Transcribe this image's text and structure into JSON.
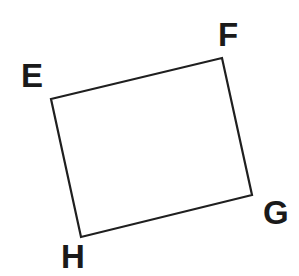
{
  "diagram": {
    "type": "quadrilateral",
    "stroke_color": "#1f1f1f",
    "label_color": "#1a1a1a",
    "vertices": [
      {
        "label": "E",
        "x": 51,
        "y": 99,
        "label_x": 21,
        "label_y": 87
      },
      {
        "label": "F",
        "x": 222,
        "y": 58,
        "label_x": 218,
        "label_y": 46
      },
      {
        "label": "G",
        "x": 252,
        "y": 195,
        "label_x": 263,
        "label_y": 224
      },
      {
        "label": "H",
        "x": 81,
        "y": 237,
        "label_x": 61,
        "label_y": 268
      }
    ]
  }
}
